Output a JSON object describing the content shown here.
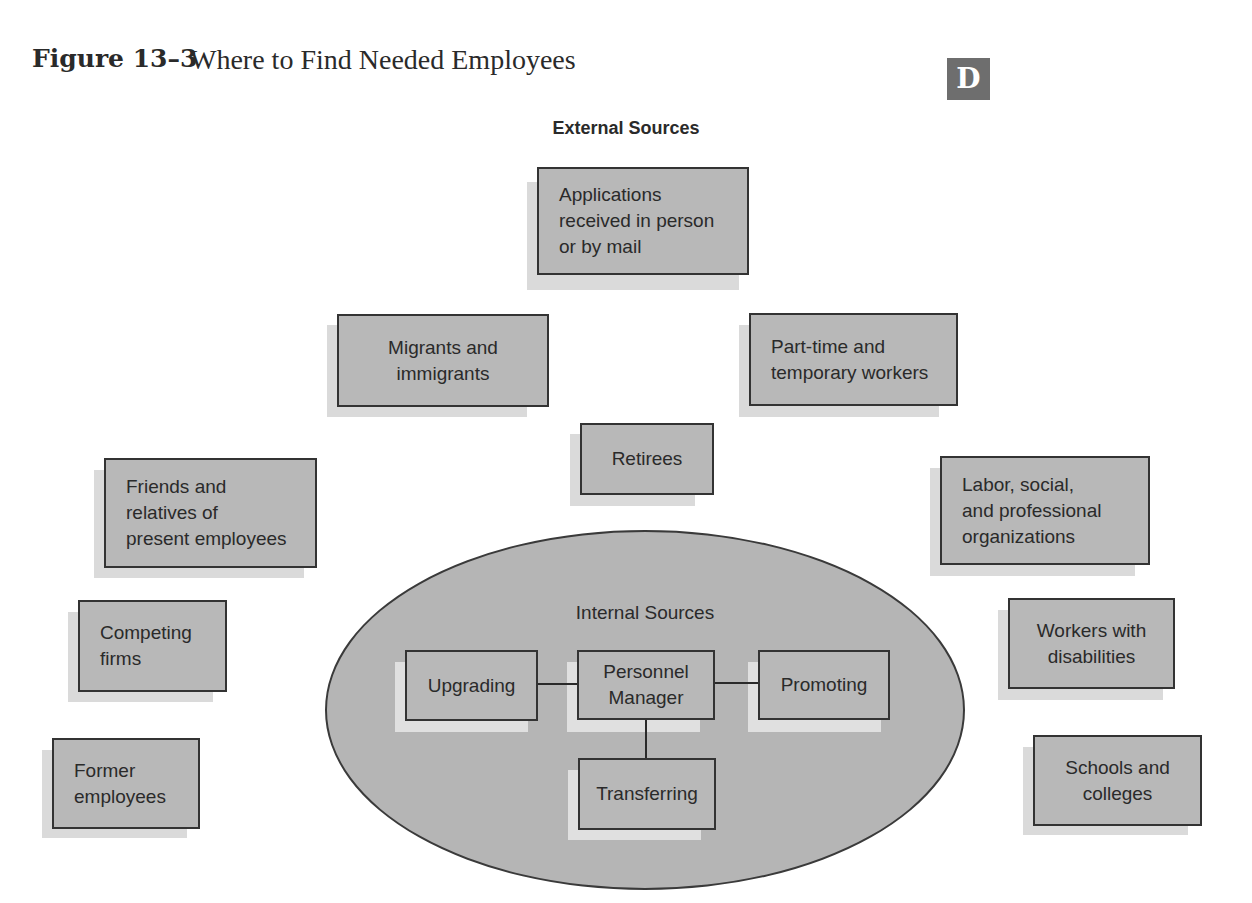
{
  "figure": {
    "label": "Figure 13–3",
    "title": "Where to Find Needed Employees",
    "badge": "D"
  },
  "external": {
    "label": "External Sources",
    "sources": [
      {
        "id": "applications",
        "lines": [
          "Applications",
          "received in person",
          "or by mail"
        ]
      },
      {
        "id": "migrants",
        "lines": [
          "Migrants and",
          "immigrants"
        ]
      },
      {
        "id": "part-time",
        "lines": [
          "Part-time and",
          "temporary workers"
        ]
      },
      {
        "id": "retirees",
        "lines": [
          "Retirees"
        ]
      },
      {
        "id": "friends",
        "lines": [
          "Friends and",
          "relatives of",
          "present employees"
        ]
      },
      {
        "id": "labor",
        "lines": [
          "Labor, social,",
          "and professional",
          "organizations"
        ]
      },
      {
        "id": "competing",
        "lines": [
          "Competing",
          "firms"
        ]
      },
      {
        "id": "workers-disabilities",
        "lines": [
          "Workers with",
          "disabilities"
        ]
      },
      {
        "id": "former",
        "lines": [
          "Former",
          "employees"
        ]
      },
      {
        "id": "schools",
        "lines": [
          "Schools and",
          "colleges"
        ]
      }
    ]
  },
  "internal": {
    "label": "Internal Sources",
    "center": {
      "lines": [
        "Personnel",
        "Manager"
      ]
    },
    "methods": [
      {
        "id": "upgrading",
        "label": "Upgrading"
      },
      {
        "id": "promoting",
        "label": "Promoting"
      },
      {
        "id": "transferring",
        "label": "Transferring"
      }
    ]
  },
  "colors": {
    "box_fill": "#b8b8b8",
    "ellipse_fill": "#b5b5b5",
    "border": "#333333",
    "badge_fill": "#6e6e6e"
  }
}
